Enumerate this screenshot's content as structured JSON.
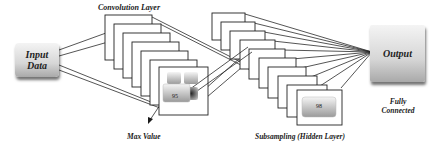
{
  "diagram": {
    "nodes": {
      "input": {
        "label_line1": "Input",
        "label_line2": "Data"
      },
      "output": {
        "label": "Output"
      },
      "conv_layer": {
        "label": "Convolution Layer",
        "map_count": 7,
        "pooled_value": "95"
      },
      "subsampling": {
        "label": "Subsampling (Hidden Layer)",
        "map_count": 10,
        "pooled_value": "98"
      }
    },
    "annotations": {
      "max_value": "Max Value",
      "fully_connected_line1": "Fully",
      "fully_connected_line2": "Connected"
    },
    "colors": {
      "line": "#2a2a2a",
      "map_fill": "#ffffff",
      "box_light": "#f4f4f4",
      "box_dark": "#a9a9a9"
    }
  }
}
